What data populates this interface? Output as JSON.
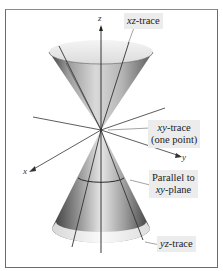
{
  "figure": {
    "type": "double cone with traces",
    "axes": {
      "z": "z",
      "y": "y",
      "x": "x"
    },
    "labels": {
      "xz_trace": {
        "var": "xz",
        "suffix": "-trace"
      },
      "xy_trace": {
        "var": "xy",
        "suffix": "-trace",
        "line2": "(one point)"
      },
      "parallel": {
        "line1": "Parallel to",
        "var": "xy",
        "suffix": "-plane"
      },
      "yz_trace": {
        "var": "yz",
        "suffix": "-trace"
      }
    },
    "colors": {
      "frame": "#6b6b6b",
      "label_bg": "#ececec",
      "cone_dark": "#4a4a4a",
      "cone_light": "#f2f2f2"
    }
  }
}
